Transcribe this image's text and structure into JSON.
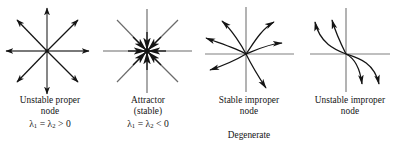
{
  "figure": {
    "background_color": "#ffffff",
    "stroke_color": "#1a1a1a",
    "axis_color": "#666666"
  },
  "panels": [
    {
      "id": "unstable-proper-node",
      "diagram_type": "star-node-outward",
      "caption_line1": "Unstable proper",
      "caption_line2": "node",
      "eigenvalues": "λ1 = λ2 > 0",
      "eig_symbol_1": "λ",
      "eig_sub_1": "1",
      "eig_equals": " = ",
      "eig_symbol_2": "λ",
      "eig_sub_2": "2",
      "eig_relation": " > 0",
      "ray_count": 8,
      "arrow_direction": "outward"
    },
    {
      "id": "attractor",
      "diagram_type": "star-node-inward",
      "caption_line1": "Attractor",
      "caption_line2": "(stable)",
      "eigenvalues": "λ1 = λ2 < 0",
      "eig_symbol_1": "λ",
      "eig_sub_1": "1",
      "eig_equals": " = ",
      "eig_symbol_2": "λ",
      "eig_sub_2": "2",
      "eig_relation": " < 0",
      "ray_count": 8,
      "arrow_direction": "inward"
    },
    {
      "id": "stable-improper-node",
      "diagram_type": "improper-node-curves",
      "caption_line1": "Stable improper",
      "caption_line2": "node",
      "eigenvalues": "",
      "curve_count": 6,
      "arrow_direction": "outward"
    },
    {
      "id": "unstable-improper-node",
      "diagram_type": "improper-node-curves",
      "caption_line1": "Unstable improper",
      "caption_line2": "node",
      "eigenvalues": "",
      "curve_count": 4,
      "arrow_direction": "outward"
    }
  ],
  "group_label": {
    "text": "Degenerate",
    "spans_panels": [
      "stable-improper-node",
      "unstable-improper-node"
    ]
  }
}
